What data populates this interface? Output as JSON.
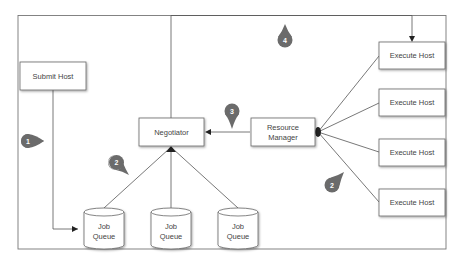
{
  "diagram": {
    "type": "architecture-flow",
    "colors": {
      "line": "#555555",
      "box_border": "#666666",
      "box_fill": "#ffffff",
      "marker_fill": "#6b6b6b",
      "text": "#444444"
    },
    "nodes": {
      "submit_host": {
        "label": "Submit Host"
      },
      "negotiator": {
        "label": "Negotiator"
      },
      "resource_manager": {
        "line1": "Resource",
        "line2": "Manager"
      },
      "execute_hosts": [
        {
          "label": "Execute Host"
        },
        {
          "label": "Execute Host"
        },
        {
          "label": "Execute Host"
        },
        {
          "label": "Execute Host"
        }
      ],
      "job_queues": [
        {
          "line1": "Job",
          "line2": "Queue"
        },
        {
          "line1": "Job",
          "line2": "Queue"
        },
        {
          "line1": "Job",
          "line2": "Queue"
        }
      ]
    },
    "markers": [
      {
        "label": "1",
        "meaning": "Submit Host to Job Queue"
      },
      {
        "label": "2",
        "meaning": "Job Queues to Negotiator"
      },
      {
        "label": "3",
        "meaning": "Resource Manager to Negotiator"
      },
      {
        "label": "4",
        "meaning": "Negotiator to Execute Host"
      },
      {
        "label": "2",
        "meaning": "Execute Hosts to Resource Manager"
      }
    ]
  }
}
